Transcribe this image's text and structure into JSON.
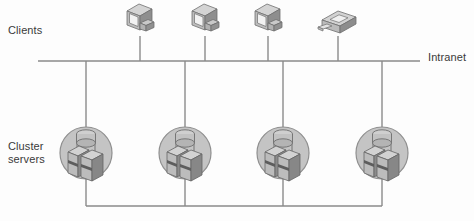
{
  "diagram": {
    "background_color": "#fdfdfd",
    "line_color": "#8a8a8a",
    "labels": {
      "clients": "Clients",
      "cluster_servers": "Cluster\nservers",
      "intranet": "Intranet",
      "bottom_caption": ""
    },
    "buses": [
      {
        "name": "intranet-bus",
        "label": "Intranet",
        "y": 61,
        "x_start": 38,
        "x_end": 420
      },
      {
        "name": "cluster-bus",
        "label": "",
        "y": 206,
        "x_start": 86,
        "x_end": 382
      }
    ],
    "clients": [
      {
        "name": "workstation-1",
        "type": "workstation",
        "x": 140,
        "y": 20,
        "drop_to_y": 61
      },
      {
        "name": "workstation-2",
        "type": "workstation",
        "x": 205,
        "y": 20,
        "drop_to_y": 61
      },
      {
        "name": "workstation-3",
        "type": "workstation",
        "x": 268,
        "y": 20,
        "drop_to_y": 61
      },
      {
        "name": "printer-1",
        "type": "printer",
        "x": 338,
        "y": 22,
        "drop_to_y": 61
      }
    ],
    "clusters": [
      {
        "name": "cluster-1",
        "x": 86,
        "y": 153,
        "radius": 26,
        "servers": 2,
        "storage": 1
      },
      {
        "name": "cluster-2",
        "x": 185,
        "y": 153,
        "radius": 26,
        "servers": 2,
        "storage": 1
      },
      {
        "name": "cluster-3",
        "x": 283,
        "y": 153,
        "radius": 26,
        "servers": 2,
        "storage": 1
      },
      {
        "name": "cluster-4",
        "x": 382,
        "y": 153,
        "radius": 26,
        "servers": 2,
        "storage": 1
      }
    ],
    "colors": {
      "circle_fill": "#c4c4c4",
      "circle_stroke": "#8f8f8f",
      "server_light": "#d0d0d0",
      "server_mid": "#a8a8a8",
      "server_dark": "#7d7d7d",
      "monitor_light": "#d6d6d6",
      "monitor_mid": "#b0b0b0",
      "monitor_dark": "#858585",
      "text": "#3a3a3a"
    }
  }
}
